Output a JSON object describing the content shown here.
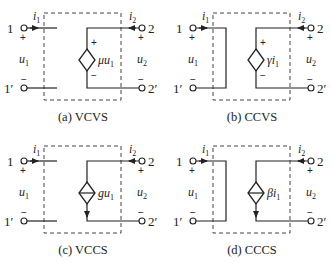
{
  "figure": {
    "panels": [
      {
        "id": "a",
        "caption": "(a) VCVS",
        "source_type": "voltage",
        "control": "voltage",
        "source_label": "μu",
        "source_label_sub": "1",
        "input_shorted": false,
        "ports": {
          "in_top": "1",
          "in_bottom": "1′",
          "out_top": "2",
          "out_bottom": "2′"
        },
        "currents": {
          "in": "i",
          "in_sub": "1",
          "out": "i",
          "out_sub": "2"
        },
        "voltages": {
          "in": "u",
          "in_sub": "1",
          "out": "u",
          "out_sub": "2"
        },
        "signs": {
          "plus": "+",
          "minus": "−"
        }
      },
      {
        "id": "b",
        "caption": "(b) CCVS",
        "source_type": "voltage",
        "control": "current",
        "source_label": "γi",
        "source_label_sub": "1",
        "input_shorted": true,
        "ports": {
          "in_top": "1",
          "in_bottom": "1′",
          "out_top": "2",
          "out_bottom": "2′"
        },
        "currents": {
          "in": "i",
          "in_sub": "1",
          "out": "i",
          "out_sub": "2"
        },
        "voltages": {
          "in": "u",
          "in_sub": "1",
          "out": "u",
          "out_sub": "2"
        },
        "signs": {
          "plus": "+",
          "minus": "−"
        }
      },
      {
        "id": "c",
        "caption": "(c) VCCS",
        "source_type": "current",
        "control": "voltage",
        "source_label": "gu",
        "source_label_sub": "1",
        "input_shorted": false,
        "ports": {
          "in_top": "1",
          "in_bottom": "1′",
          "out_top": "2",
          "out_bottom": "2′"
        },
        "currents": {
          "in": "i",
          "in_sub": "1",
          "out": "i",
          "out_sub": "2"
        },
        "voltages": {
          "in": "u",
          "in_sub": "1",
          "out": "u",
          "out_sub": "2"
        },
        "signs": {
          "plus": "+",
          "minus": "−"
        }
      },
      {
        "id": "d",
        "caption": "(d) CCCS",
        "source_type": "current",
        "control": "current",
        "source_label": "βi",
        "source_label_sub": "1",
        "input_shorted": true,
        "ports": {
          "in_top": "1",
          "in_bottom": "1′",
          "out_top": "2",
          "out_bottom": "2′"
        },
        "currents": {
          "in": "i",
          "in_sub": "1",
          "out": "i",
          "out_sub": "2"
        },
        "voltages": {
          "in": "u",
          "in_sub": "1",
          "out": "u",
          "out_sub": "2"
        },
        "signs": {
          "plus": "+",
          "minus": "−"
        }
      }
    ]
  }
}
